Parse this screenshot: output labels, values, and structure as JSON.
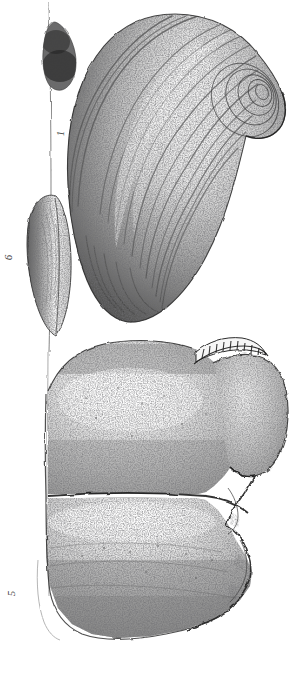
{
  "plate": {
    "title": "Fossil bivalve shells lithographic plate",
    "background_color": "#ffffff",
    "ink_color": "#2b2b2b",
    "width_px": 297,
    "height_px": 677,
    "medium": "stipple lithograph",
    "figure_count": 3
  },
  "figures": [
    {
      "number": "1",
      "name": "large-bivalve-valve-exterior",
      "description": "Large ovate bivalve valve, exterior view, strong concentric growth ridges converging on a prominent umbo at upper right",
      "label_position": "left-of-specimen",
      "label_rotation_deg": -90
    },
    {
      "number": "6",
      "name": "bivalve-lateral-profile",
      "description": "Narrow elongate lens-shaped lateral (dorsal) profile view of a closed bivalve",
      "label_position": "left-margin",
      "label_rotation_deg": -90
    },
    {
      "number": "5",
      "name": "large-shell-fragment-with-hinge",
      "description": "Large broken shell specimen showing two valves divided by a median commissure line, denticulate hinge teeth at upper right and jagged fracture along the right margin",
      "label_position": "lower-left-margin",
      "label_rotation_deg": -90
    }
  ],
  "features": {
    "growth_lines_label": "concentric growth ridges",
    "umbo_label": "umbo",
    "hinge_teeth_label": "hinge denticles",
    "commissure_label": "valve commissure",
    "fracture_label": "broken margin",
    "plate_rule_label": "vertical plate rule"
  }
}
